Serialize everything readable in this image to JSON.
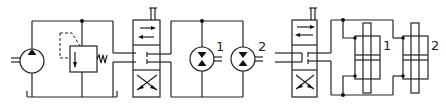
{
  "diagram": {
    "type": "hydraulic-schematic",
    "circuits": [
      {
        "name": "motor-circuit",
        "components": [
          "pump",
          "pressure-relief-valve",
          "directional-control-valve",
          "hydraulic-motor-1",
          "hydraulic-motor-2"
        ],
        "labels": {
          "motor_1": "1",
          "motor_2": "2"
        }
      },
      {
        "name": "cylinder-circuit",
        "components": [
          "directional-control-valve",
          "double-rod-cylinder-1",
          "double-rod-cylinder-2"
        ],
        "labels": {
          "cylinder_1": "1",
          "cylinder_2": "2"
        }
      }
    ]
  }
}
